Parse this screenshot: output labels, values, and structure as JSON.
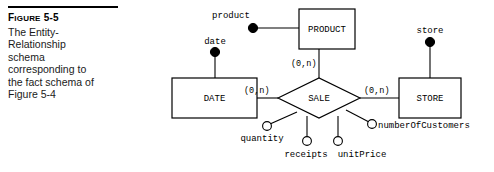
{
  "caption": {
    "rule": "horizontal-rule",
    "figure_number_prefix": "F",
    "figure_number_rest": "IGURE",
    "figure_number": "Figure 5-5",
    "figure_number_value": "5-5",
    "text_line1": "The Entity-",
    "text_line2": "Relationship",
    "text_line3": "schema",
    "text_line4": "corresponding to",
    "text_line5": "the fact schema of",
    "text_line6": "Figure 5-4"
  },
  "diagram": {
    "entities": [
      {
        "id": "product",
        "label": "PRODUCT"
      },
      {
        "id": "date",
        "label": "DATE"
      },
      {
        "id": "store",
        "label": "STORE"
      }
    ],
    "relationship": {
      "id": "sale",
      "label": "SALE"
    },
    "identifier_attributes": [
      {
        "id": "product-attr",
        "label": "product"
      },
      {
        "id": "date-attr",
        "label": "date"
      },
      {
        "id": "store-attr",
        "label": "store"
      }
    ],
    "measure_attributes": [
      {
        "id": "quantity",
        "label": "quantity"
      },
      {
        "id": "receipts",
        "label": "receipts"
      },
      {
        "id": "unit-price",
        "label": "unitPrice"
      },
      {
        "id": "number-of-customers",
        "label": "numberOfCustomers"
      }
    ],
    "cardinalities": [
      {
        "id": "card-product-sale",
        "label": "(0,n)"
      },
      {
        "id": "card-date-sale",
        "label": "(0,n)"
      },
      {
        "id": "card-sale-store",
        "label": "(0,n)"
      }
    ],
    "colors": {
      "stroke": "#000000",
      "fill": "#ffffff",
      "text": "#000000"
    }
  }
}
